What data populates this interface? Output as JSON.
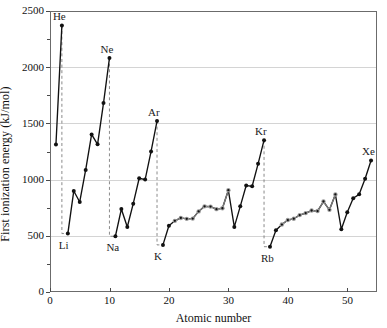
{
  "chart_data": {
    "type": "line",
    "title": "",
    "xlabel": "Atomic number",
    "ylabel": "First ionization energy (kJ/mol)",
    "xlim": [
      0,
      55
    ],
    "ylim": [
      0,
      2500
    ],
    "xticks": [
      0,
      10,
      20,
      30,
      40,
      50
    ],
    "yticks": [
      0,
      500,
      1000,
      1500,
      2000,
      2500
    ],
    "xtick_labels": [
      "0",
      "10",
      "20",
      "30",
      "40",
      "50"
    ],
    "ytick_labels": [
      "0",
      "500",
      "1000",
      "1500",
      "2000",
      "2500"
    ],
    "grid": "horizontal",
    "legend": "none",
    "marker_color_main": "#111111",
    "marker_color_transition": "#9a9a9a",
    "dropline_color": "#7d7d7d",
    "x": [
      1,
      2,
      3,
      4,
      5,
      6,
      7,
      8,
      9,
      10,
      11,
      12,
      13,
      14,
      15,
      16,
      17,
      18,
      19,
      20,
      21,
      22,
      23,
      24,
      25,
      26,
      27,
      28,
      29,
      30,
      31,
      32,
      33,
      34,
      35,
      36,
      37,
      38,
      39,
      40,
      41,
      42,
      43,
      44,
      45,
      46,
      47,
      48,
      49,
      50,
      51,
      52,
      53,
      54
    ],
    "values": [
      1312,
      2372,
      520,
      899,
      801,
      1086,
      1402,
      1314,
      1681,
      2081,
      496,
      738,
      578,
      786,
      1012,
      1000,
      1251,
      1521,
      419,
      590,
      633,
      659,
      651,
      653,
      717,
      762,
      760,
      737,
      745,
      906,
      579,
      762,
      947,
      941,
      1140,
      1351,
      403,
      549,
      600,
      640,
      652,
      684,
      702,
      725,
      720,
      805,
      731,
      868,
      558,
      709,
      834,
      869,
      1008,
      1170
    ],
    "series_labels": [
      "First ionization energy"
    ],
    "annotations": [
      {
        "text": "He",
        "x": 2,
        "y": 2372
      },
      {
        "text": "Ne",
        "x": 10,
        "y": 2081
      },
      {
        "text": "Ar",
        "x": 18,
        "y": 1521
      },
      {
        "text": "Kr",
        "x": 36,
        "y": 1351
      },
      {
        "text": "Xe",
        "x": 54,
        "y": 1170
      },
      {
        "text": "Li",
        "x": 3,
        "y": 520
      },
      {
        "text": "Na",
        "x": 11,
        "y": 496
      },
      {
        "text": "K",
        "x": 19,
        "y": 419
      },
      {
        "text": "Rb",
        "x": 37,
        "y": 403
      }
    ],
    "transition_metal_ranges": [
      [
        21,
        30
      ],
      [
        39,
        48
      ]
    ],
    "dropline_pairs": [
      [
        2,
        3
      ],
      [
        10,
        11
      ],
      [
        18,
        19
      ],
      [
        36,
        37
      ]
    ]
  },
  "axes": {
    "y_title": "First ionization energy (kJ/mol)",
    "x_title": "Atomic number"
  }
}
